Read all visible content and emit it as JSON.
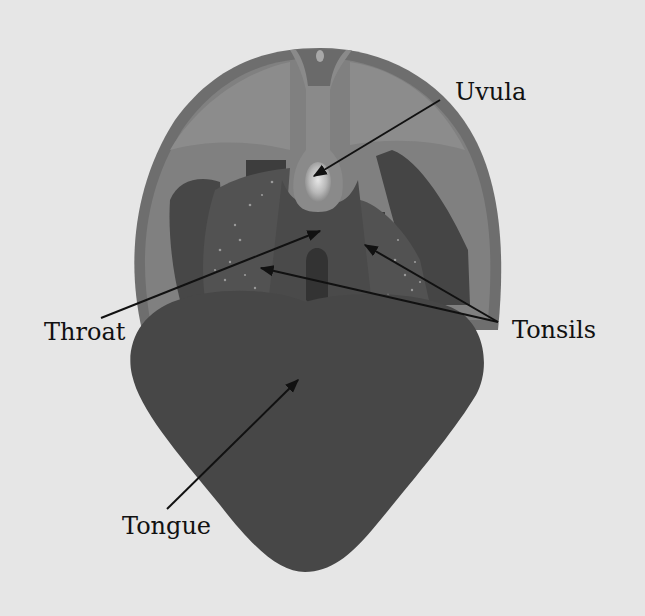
{
  "diagram": {
    "colors": {
      "background": "#e6e6e6",
      "head_outer": "#6f6f6f",
      "head_inner": "#7e7e7e",
      "palate_side": "#858585",
      "tissue_dark": "#454545",
      "tissue_mid": "#555555",
      "uvula": "#8a8a8a",
      "uvula_tip": "#d8d8d8",
      "throat_slot": "#333333",
      "tongue": "#474747",
      "arrow": "#111111"
    },
    "labels": [
      {
        "id": "uvula",
        "text": "Uvula",
        "arrow_from": [
          440,
          100
        ],
        "arrow_to": [
          314,
          176
        ]
      },
      {
        "id": "throat",
        "text": "Throat",
        "arrow_from": [
          101,
          318
        ],
        "arrow_to": [
          320,
          231
        ]
      },
      {
        "id": "tonsils",
        "text": "Tonsils",
        "arrows": [
          {
            "arrow_from": [
              498,
              322
            ],
            "arrow_to": [
              261,
              268
            ]
          },
          {
            "arrow_from": [
              498,
              322
            ],
            "arrow_to": [
              365,
              245
            ]
          }
        ]
      },
      {
        "id": "tongue",
        "text": "Tongue",
        "arrow_from": [
          167,
          509
        ],
        "arrow_to": [
          298,
          380
        ]
      }
    ]
  }
}
